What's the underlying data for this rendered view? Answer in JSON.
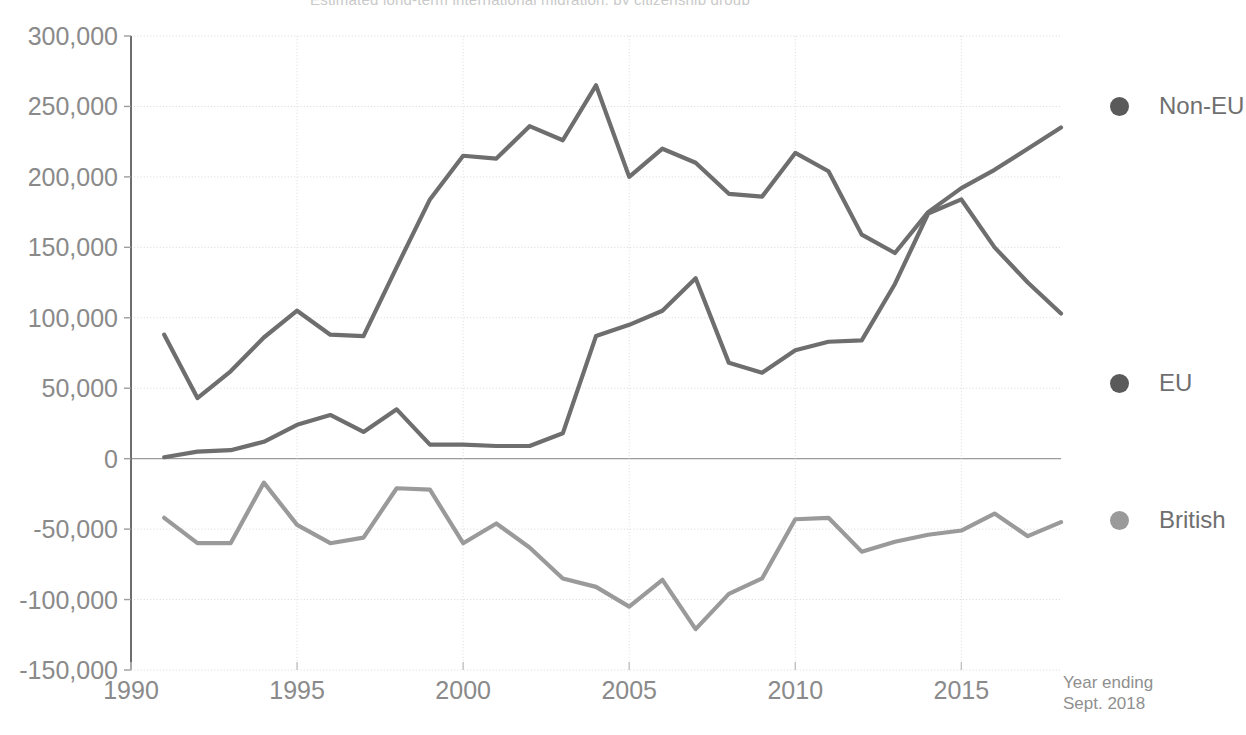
{
  "chart_data": {
    "type": "line",
    "title": "Estimated long-term international migration, by citizenship group",
    "xlabel": "",
    "ylabel": "",
    "x": [
      1991,
      1992,
      1993,
      1994,
      1995,
      1996,
      1997,
      1998,
      1999,
      2000,
      2001,
      2002,
      2003,
      2004,
      2005,
      2006,
      2007,
      2008,
      2009,
      2010,
      2011,
      2012,
      2013,
      2014,
      2015,
      2016,
      2017,
      2018
    ],
    "xlim": [
      1990,
      2018
    ],
    "ylim": [
      -150000,
      300000
    ],
    "ytick_values": [
      300000,
      250000,
      200000,
      150000,
      100000,
      50000,
      0,
      -50000,
      -100000,
      -150000
    ],
    "ytick_labels": [
      "300,000",
      "250,000",
      "200,000",
      "150,000",
      "100,000",
      "50,000",
      "0",
      "-50,000",
      "-100,000",
      "-150,000"
    ],
    "xtick_values": [
      1990,
      1995,
      2000,
      2005,
      2010,
      2015
    ],
    "xtick_labels": [
      "1990",
      "1995",
      "2000",
      "2005",
      "2010",
      "2015"
    ],
    "grid": true,
    "grid_axis": "y",
    "legend_position": "right",
    "axis_note_line1": "Year ending",
    "axis_note_line2": "Sept. 2018",
    "series": [
      {
        "name": "Non-EU",
        "color": "#6e6e6e",
        "values": [
          88000,
          43000,
          62000,
          86000,
          105000,
          88000,
          87000,
          136000,
          184000,
          215000,
          213000,
          236000,
          226000,
          265000,
          200000,
          220000,
          210000,
          188000,
          186000,
          217000,
          204000,
          159000,
          146000,
          175000,
          192000,
          205000,
          220000,
          235000
        ]
      },
      {
        "name": "EU",
        "color": "#6e6e6e",
        "values": [
          1000,
          5000,
          6000,
          12000,
          24000,
          31000,
          19000,
          35000,
          10000,
          10000,
          9000,
          9000,
          18000,
          87000,
          95000,
          105000,
          128000,
          68000,
          61000,
          77000,
          83000,
          84000,
          124000,
          174000,
          184000,
          150000,
          125000,
          103000
        ]
      },
      {
        "name": "British",
        "color": "#9a9a9a",
        "values": [
          -42000,
          -60000,
          -60000,
          -17000,
          -47000,
          -60000,
          -56000,
          -21000,
          -22000,
          -60000,
          -46000,
          -63000,
          -85000,
          -91000,
          -105000,
          -86000,
          -121000,
          -96000,
          -85000,
          -43000,
          -42000,
          -66000,
          -59000,
          -54000,
          -51000,
          -39000,
          -55000,
          -45000
        ]
      }
    ]
  },
  "legend": {
    "items": [
      {
        "label": "Non-EU",
        "color": "#5a5a5a",
        "top": 92
      },
      {
        "label": "EU",
        "color": "#5a5a5a",
        "top": 369
      },
      {
        "label": "British",
        "color": "#9a9a9a",
        "top": 506
      }
    ]
  }
}
